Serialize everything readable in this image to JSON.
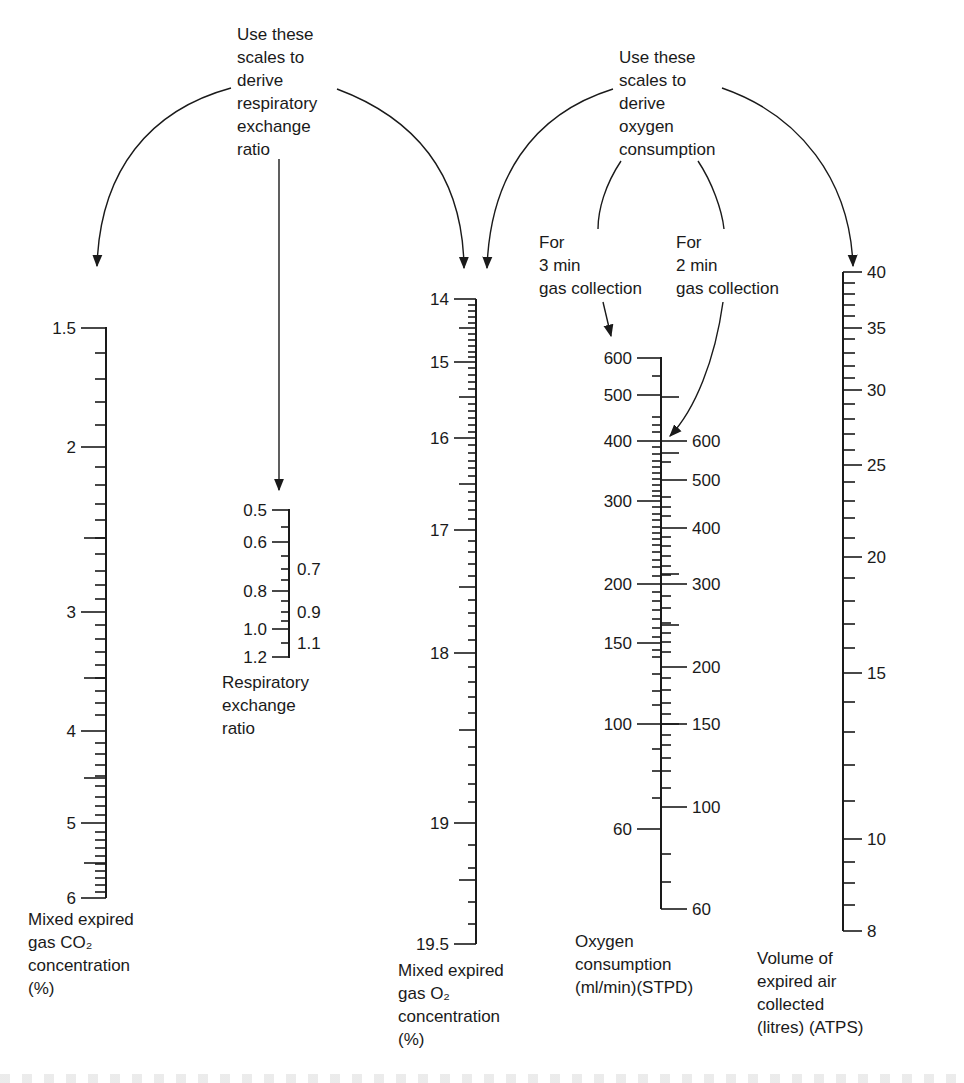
{
  "annotations": {
    "rer_note": [
      "Use these",
      "scales to",
      "derive",
      "respiratory",
      "exchange",
      "ratio"
    ],
    "o2_note": [
      "Use these",
      "scales to",
      "derive",
      "oxygen",
      "consumption"
    ],
    "three_min": [
      "For",
      "3 min",
      "gas collection"
    ],
    "two_min": [
      "For",
      "2 min",
      "gas collection"
    ]
  },
  "scales": {
    "co2": {
      "title": [
        "Mixed expired",
        "gas CO₂",
        "concentration",
        "(%)"
      ],
      "axis_x": 106,
      "y_top": 327,
      "y_bottom": 898,
      "major": [
        {
          "v": "1.5",
          "y": 328
        },
        {
          "v": "2",
          "y": 447
        },
        {
          "v": "3",
          "y": 612
        },
        {
          "v": "4",
          "y": 731
        },
        {
          "v": "5",
          "y": 823
        },
        {
          "v": "6",
          "y": 898
        }
      ],
      "minor": [
        353,
        379,
        402,
        425,
        467,
        485,
        504,
        520,
        538,
        554,
        571,
        585,
        599,
        625,
        639,
        652,
        665,
        678,
        691,
        703,
        715,
        743,
        754,
        765,
        776,
        786,
        797,
        806,
        815,
        832,
        840,
        848,
        856,
        864,
        871,
        878,
        885,
        892
      ],
      "mid": [
        538,
        678,
        778,
        863
      ]
    },
    "rer": {
      "title": [
        "Respiratory",
        "exchange",
        "ratio"
      ],
      "axis_x": 289,
      "y_top": 509,
      "y_bottom": 658,
      "left_labels": [
        {
          "v": "0.5",
          "y": 510
        },
        {
          "v": "0.6",
          "y": 542
        },
        {
          "v": "0.8",
          "y": 591
        },
        {
          "v": "1.0",
          "y": 629
        },
        {
          "v": "1.2",
          "y": 657
        }
      ],
      "right_labels": [
        {
          "v": "0.7",
          "y": 569
        },
        {
          "v": "0.9",
          "y": 612
        },
        {
          "v": "1.1",
          "y": 643
        }
      ],
      "minor": [
        527,
        556,
        569,
        580,
        601,
        612,
        621,
        643
      ]
    },
    "o2": {
      "title": [
        "Mixed expired",
        "gas O₂",
        "concentration",
        "(%)"
      ],
      "axis_x": 476,
      "y_top": 299,
      "y_bottom": 944,
      "major": [
        {
          "v": "14",
          "y": 299
        },
        {
          "v": "15",
          "y": 362
        },
        {
          "v": "16",
          "y": 438
        },
        {
          "v": "17",
          "y": 530
        },
        {
          "v": "18",
          "y": 653
        },
        {
          "v": "19",
          "y": 823
        },
        {
          "v": "19.5",
          "y": 944
        }
      ],
      "mid": [
        328,
        397,
        484,
        587,
        730,
        880
      ],
      "minor": [
        305,
        311,
        317,
        323,
        334,
        340,
        346,
        352,
        357,
        368,
        375,
        382,
        389,
        404,
        411,
        418,
        425,
        432,
        445,
        453,
        461,
        468,
        476,
        492,
        501,
        510,
        519,
        541,
        552,
        564,
        576,
        600,
        613,
        626,
        640,
        667,
        682,
        697,
        713,
        747,
        765,
        784,
        802,
        845,
        868,
        902,
        924
      ]
    },
    "vo2": {
      "title": [
        "Oxygen",
        "consumption",
        "(ml/min)(STPD)"
      ],
      "axis_x": 661,
      "y_top": 357,
      "y_bottom": 909,
      "left_labels_3min": [
        {
          "v": "600",
          "y": 358
        },
        {
          "v": "500",
          "y": 395
        },
        {
          "v": "400",
          "y": 441
        },
        {
          "v": "300",
          "y": 501
        },
        {
          "v": "200",
          "y": 584
        },
        {
          "v": "150",
          "y": 643
        },
        {
          "v": "100",
          "y": 724
        },
        {
          "v": "60",
          "y": 829
        }
      ],
      "right_labels_2min": [
        {
          "v": "600",
          "y": 441
        },
        {
          "v": "500",
          "y": 480
        },
        {
          "v": "400",
          "y": 528
        },
        {
          "v": "300",
          "y": 584
        },
        {
          "v": "200",
          "y": 667
        },
        {
          "v": "150",
          "y": 724
        },
        {
          "v": "100",
          "y": 807
        },
        {
          "v": "60",
          "y": 909
        }
      ],
      "left_minor": [
        376,
        417,
        425,
        432,
        447,
        454,
        461,
        467,
        473,
        479,
        485,
        491,
        496,
        507,
        514,
        520,
        527,
        533,
        539,
        545,
        552,
        560,
        567,
        576,
        592,
        601,
        610,
        619,
        628,
        637,
        650,
        657,
        674,
        691,
        705,
        749,
        771,
        798
      ],
      "right_minor": [
        462,
        497,
        507,
        516,
        537,
        546,
        556,
        566,
        575,
        596,
        608,
        623,
        633,
        642,
        652,
        678,
        690,
        703,
        714,
        735,
        745,
        758,
        771,
        788,
        854,
        882
      ],
      "right_long": [
        397,
        453,
        574,
        625,
        724
      ]
    },
    "volume": {
      "title": [
        "Volume of",
        "expired air",
        "collected",
        "(litres) (ATPS)"
      ],
      "axis_x": 843,
      "y_top": 272,
      "y_bottom": 931,
      "major": [
        {
          "v": "40",
          "y": 272
        },
        {
          "v": "35",
          "y": 328
        },
        {
          "v": "30",
          "y": 390
        },
        {
          "v": "25",
          "y": 465
        },
        {
          "v": "20",
          "y": 557
        },
        {
          "v": "15",
          "y": 673
        },
        {
          "v": "10",
          "y": 839
        },
        {
          "v": "8",
          "y": 931
        }
      ],
      "minor": [
        283,
        294,
        305,
        316,
        339,
        353,
        366,
        378,
        404,
        419,
        434,
        450,
        482,
        501,
        518,
        538,
        578,
        601,
        624,
        648,
        702,
        732,
        765,
        801,
        862,
        883,
        905
      ]
    }
  }
}
